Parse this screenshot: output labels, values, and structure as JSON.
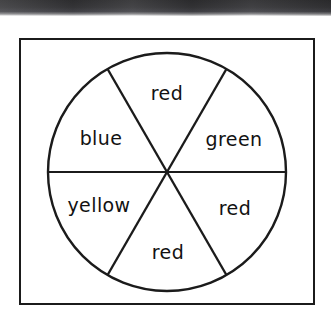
{
  "figure": {
    "kind": "spinner-wheel-diagram",
    "outline_color": "#1b1b1b",
    "fill_color": "#ffffff",
    "label_color": "#121212",
    "scan_edge_color": "#37373a",
    "circle": {
      "center_x": 167,
      "center_y": 172,
      "radius": 119,
      "sector_count": 6,
      "sector_angle_degrees": 60
    },
    "sectors": [
      {
        "position": "top",
        "label": "red",
        "center_angle_degrees": 270
      },
      {
        "position": "upper-right",
        "label": "green",
        "center_angle_degrees": 330
      },
      {
        "position": "lower-right",
        "label": "red",
        "center_angle_degrees": 30
      },
      {
        "position": "bottom",
        "label": "red",
        "center_angle_degrees": 90
      },
      {
        "position": "lower-left",
        "label": "yellow",
        "center_angle_degrees": 150
      },
      {
        "position": "upper-left",
        "label": "blue",
        "center_angle_degrees": 210
      }
    ]
  }
}
